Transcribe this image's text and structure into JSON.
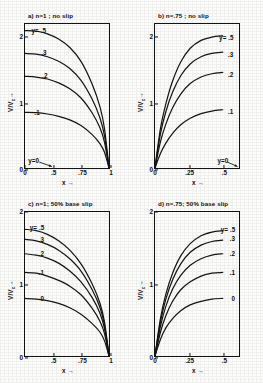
{
  "figure": {
    "axis_labels": {
      "x": "x →",
      "y": "V/V",
      "y_sub": "c",
      "y_arrow": "→"
    }
  },
  "chart_data": [
    {
      "type": "line",
      "panel_id": "a",
      "title": "a) n=1 ; no slip",
      "xlabel": "x →",
      "ylabel": "V/Vc →",
      "xlim": [
        0.25,
        1.0
      ],
      "ylim": [
        0,
        2.2
      ],
      "xticks": [
        0.25,
        0.5,
        0.75,
        1.0
      ],
      "xticklabels": [
        "0",
        ".5",
        ".75",
        "1"
      ],
      "yticks": [
        0,
        1,
        2
      ],
      "yticklabels": [
        "0",
        "1",
        "2"
      ],
      "grid": false,
      "legend_position": "inline-left",
      "annotations": [
        {
          "text": "y=0",
          "x": 0.33,
          "y": 0.12,
          "arrow": true
        }
      ],
      "series": [
        {
          "name": "y=.5",
          "label": "y= .5",
          "y0": 2.1,
          "x": [
            0.25,
            0.35,
            0.45,
            0.55,
            0.65,
            0.75,
            0.85,
            0.92,
            0.96,
            1.0
          ],
          "values": [
            2.1,
            2.09,
            2.05,
            1.97,
            1.84,
            1.63,
            1.28,
            0.93,
            0.6,
            0.0
          ]
        },
        {
          "name": ".3",
          "label": ".3",
          "y0": 1.75,
          "x": [
            0.25,
            0.35,
            0.45,
            0.55,
            0.65,
            0.75,
            0.85,
            0.92,
            0.96,
            1.0
          ],
          "values": [
            1.75,
            1.74,
            1.7,
            1.63,
            1.52,
            1.34,
            1.05,
            0.76,
            0.49,
            0.0
          ]
        },
        {
          "name": ".2",
          "label": ".2",
          "y0": 1.4,
          "x": [
            0.25,
            0.35,
            0.45,
            0.55,
            0.65,
            0.75,
            0.85,
            0.92,
            0.96,
            1.0
          ],
          "values": [
            1.4,
            1.39,
            1.36,
            1.3,
            1.21,
            1.07,
            0.84,
            0.61,
            0.39,
            0.0
          ]
        },
        {
          "name": ".1",
          "label": ".1",
          "y0": 0.85,
          "x": [
            0.25,
            0.35,
            0.45,
            0.55,
            0.65,
            0.75,
            0.85,
            0.92,
            0.96,
            1.0
          ],
          "values": [
            0.85,
            0.845,
            0.825,
            0.79,
            0.735,
            0.65,
            0.51,
            0.37,
            0.24,
            0.0
          ]
        },
        {
          "name": "0",
          "label": "y=0",
          "y0": 0.0,
          "x": [
            0.25,
            1.0
          ],
          "values": [
            0.0,
            0.0
          ]
        }
      ]
    },
    {
      "type": "line",
      "panel_id": "b",
      "title": "b) n=.75 ; no slip",
      "xlabel": "x →",
      "ylabel": "V/Vc →",
      "xlim": [
        0.0,
        0.62
      ],
      "ylim": [
        0,
        2.2
      ],
      "xticks": [
        0.0,
        0.25,
        0.5
      ],
      "xticklabels": [
        "0",
        ".25",
        ".5"
      ],
      "yticks": [
        0,
        1,
        2
      ],
      "yticklabels": [
        "0",
        "1",
        "2"
      ],
      "grid": false,
      "legend_position": "inline-right",
      "annotations": [
        {
          "text": "y=0",
          "x": 0.5,
          "y": 0.12,
          "arrow": true
        }
      ],
      "series": [
        {
          "name": "y=.5",
          "label": "y= .5",
          "y0": 0.0,
          "x": [
            0.0,
            0.04,
            0.08,
            0.13,
            0.19,
            0.26,
            0.34,
            0.42,
            0.5
          ],
          "values": [
            0.0,
            0.6,
            0.98,
            1.33,
            1.62,
            1.83,
            1.95,
            2.0,
            2.02
          ]
        },
        {
          "name": ".3",
          "label": ".3",
          "y0": 0.0,
          "x": [
            0.0,
            0.04,
            0.08,
            0.13,
            0.19,
            0.26,
            0.34,
            0.42,
            0.5
          ],
          "values": [
            0.0,
            0.52,
            0.86,
            1.16,
            1.41,
            1.59,
            1.7,
            1.75,
            1.77
          ]
        },
        {
          "name": ".2",
          "label": ".2",
          "y0": 0.0,
          "x": [
            0.0,
            0.04,
            0.08,
            0.13,
            0.19,
            0.26,
            0.34,
            0.42,
            0.5
          ],
          "values": [
            0.0,
            0.4,
            0.67,
            0.92,
            1.13,
            1.29,
            1.39,
            1.44,
            1.46
          ]
        },
        {
          "name": ".1",
          "label": ".1",
          "y0": 0.0,
          "x": [
            0.0,
            0.04,
            0.08,
            0.13,
            0.19,
            0.26,
            0.34,
            0.42,
            0.5
          ],
          "values": [
            0.0,
            0.22,
            0.38,
            0.53,
            0.66,
            0.76,
            0.83,
            0.87,
            0.89
          ]
        },
        {
          "name": "0",
          "label": "y=0",
          "y0": 0.0,
          "x": [
            0.0,
            0.62
          ],
          "values": [
            0.0,
            0.0
          ]
        }
      ]
    },
    {
      "type": "line",
      "panel_id": "c",
      "title": "c) n=1; 50% base slip",
      "xlabel": "x →",
      "ylabel": "V/Vc →",
      "xlim": [
        0.25,
        1.0
      ],
      "ylim": [
        0,
        2.0
      ],
      "xticks": [
        0.25,
        0.5,
        0.75,
        1.0
      ],
      "xticklabels": [
        "",
        ".5",
        ".75",
        "1"
      ],
      "yticks": [
        0,
        1,
        2
      ],
      "yticklabels": [
        "0",
        "1",
        "2"
      ],
      "grid": false,
      "legend_position": "inline-left",
      "annotations": [],
      "series": [
        {
          "name": "y=.5",
          "label": "y= .5",
          "y0": 1.76,
          "x": [
            0.25,
            0.35,
            0.45,
            0.55,
            0.65,
            0.75,
            0.85,
            0.92,
            0.96,
            1.0
          ],
          "values": [
            1.76,
            1.74,
            1.69,
            1.6,
            1.47,
            1.28,
            1.0,
            0.73,
            0.47,
            0.0
          ]
        },
        {
          "name": ".3",
          "label": ".3",
          "y0": 1.62,
          "x": [
            0.25,
            0.35,
            0.45,
            0.55,
            0.65,
            0.75,
            0.85,
            0.92,
            0.96,
            1.0
          ],
          "values": [
            1.62,
            1.6,
            1.55,
            1.47,
            1.35,
            1.18,
            0.92,
            0.67,
            0.43,
            0.0
          ]
        },
        {
          "name": ".2",
          "label": ".2",
          "y0": 1.42,
          "x": [
            0.25,
            0.35,
            0.45,
            0.55,
            0.65,
            0.75,
            0.85,
            0.92,
            0.96,
            1.0
          ],
          "values": [
            1.42,
            1.4,
            1.36,
            1.29,
            1.18,
            1.03,
            0.81,
            0.59,
            0.38,
            0.0
          ]
        },
        {
          "name": ".1",
          "label": ".1",
          "y0": 1.16,
          "x": [
            0.25,
            0.35,
            0.45,
            0.55,
            0.65,
            0.75,
            0.85,
            0.92,
            0.96,
            1.0
          ],
          "values": [
            1.16,
            1.15,
            1.11,
            1.05,
            0.97,
            0.85,
            0.66,
            0.48,
            0.31,
            0.0
          ]
        },
        {
          "name": "0",
          "label": "0",
          "y0": 0.8,
          "x": [
            0.25,
            0.35,
            0.45,
            0.55,
            0.65,
            0.75,
            0.85,
            0.92,
            0.96,
            1.0
          ],
          "values": [
            0.8,
            0.79,
            0.77,
            0.73,
            0.67,
            0.58,
            0.45,
            0.33,
            0.21,
            0.0
          ]
        }
      ]
    },
    {
      "type": "line",
      "panel_id": "d",
      "title": "d) n=.75; 50% base slip",
      "xlabel": "x →",
      "ylabel": "V/Vc →",
      "xlim": [
        0.0,
        0.62
      ],
      "ylim": [
        0,
        2.0
      ],
      "xticks": [
        0.0,
        0.25,
        0.5
      ],
      "xticklabels": [
        "0",
        ".25",
        ".5"
      ],
      "yticks": [
        0,
        1,
        2
      ],
      "yticklabels": [
        "0",
        "1",
        "2"
      ],
      "grid": false,
      "legend_position": "inline-right",
      "annotations": [],
      "series": [
        {
          "name": "y=.5",
          "label": "y= .5",
          "y0": 0.0,
          "x": [
            0.0,
            0.04,
            0.08,
            0.13,
            0.19,
            0.26,
            0.34,
            0.42,
            0.5
          ],
          "values": [
            0.0,
            0.52,
            0.86,
            1.15,
            1.39,
            1.56,
            1.67,
            1.72,
            1.74
          ]
        },
        {
          "name": ".3",
          "label": ".3",
          "y0": 0.0,
          "x": [
            0.0,
            0.04,
            0.08,
            0.13,
            0.19,
            0.26,
            0.34,
            0.42,
            0.5
          ],
          "values": [
            0.0,
            0.47,
            0.79,
            1.06,
            1.28,
            1.44,
            1.54,
            1.59,
            1.61
          ]
        },
        {
          "name": ".2",
          "label": ".2",
          "y0": 0.0,
          "x": [
            0.0,
            0.04,
            0.08,
            0.13,
            0.19,
            0.26,
            0.34,
            0.42,
            0.5
          ],
          "values": [
            0.0,
            0.41,
            0.69,
            0.93,
            1.12,
            1.26,
            1.35,
            1.4,
            1.42
          ]
        },
        {
          "name": ".1",
          "label": ".1",
          "y0": 0.0,
          "x": [
            0.0,
            0.04,
            0.08,
            0.13,
            0.19,
            0.26,
            0.34,
            0.42,
            0.5
          ],
          "values": [
            0.0,
            0.33,
            0.56,
            0.76,
            0.92,
            1.03,
            1.11,
            1.15,
            1.16
          ]
        },
        {
          "name": "0",
          "label": "0",
          "y0": 0.0,
          "x": [
            0.0,
            0.04,
            0.08,
            0.13,
            0.19,
            0.26,
            0.34,
            0.42,
            0.5
          ],
          "values": [
            0.0,
            0.23,
            0.39,
            0.52,
            0.63,
            0.71,
            0.76,
            0.79,
            0.8
          ]
        }
      ]
    }
  ],
  "panel_label_positions": [
    {
      "panel": "a",
      "labels": [
        {
          "text": "y= .5",
          "fx": 0.16,
          "fy": 2.1
        },
        {
          "text": ".3",
          "fx": 0.22,
          "fy": 1.76
        },
        {
          "text": ".2",
          "fx": 0.23,
          "fy": 1.42
        },
        {
          "text": ".1",
          "fx": 0.14,
          "fy": 0.86
        },
        {
          "text": "y=0",
          "fx": 0.1,
          "fy": 0.13
        }
      ]
    },
    {
      "panel": "b",
      "labels": [
        {
          "text": "y= .5",
          "fx": 0.83,
          "fy": 1.99
        },
        {
          "text": ".3",
          "fx": 0.88,
          "fy": 1.73
        },
        {
          "text": ".2",
          "fx": 0.88,
          "fy": 1.43
        },
        {
          "text": ".1",
          "fx": 0.88,
          "fy": 0.87
        },
        {
          "text": "y=0",
          "fx": 0.79,
          "fy": 0.13
        }
      ]
    },
    {
      "panel": "c",
      "labels": [
        {
          "text": "y= .5",
          "fx": 0.14,
          "fy": 1.78
        },
        {
          "text": ".3",
          "fx": 0.19,
          "fy": 1.62
        },
        {
          "text": ".2",
          "fx": 0.19,
          "fy": 1.42
        },
        {
          "text": ".1",
          "fx": 0.19,
          "fy": 1.16
        },
        {
          "text": "0",
          "fx": 0.2,
          "fy": 0.81
        }
      ]
    },
    {
      "panel": "d",
      "labels": [
        {
          "text": "y= .5",
          "fx": 0.85,
          "fy": 1.76
        },
        {
          "text": ".3",
          "fx": 0.9,
          "fy": 1.63
        },
        {
          "text": ".2",
          "fx": 0.9,
          "fy": 1.42
        },
        {
          "text": ".1",
          "fx": 0.9,
          "fy": 1.16
        },
        {
          "text": "0",
          "fx": 0.91,
          "fy": 0.81
        }
      ]
    }
  ]
}
